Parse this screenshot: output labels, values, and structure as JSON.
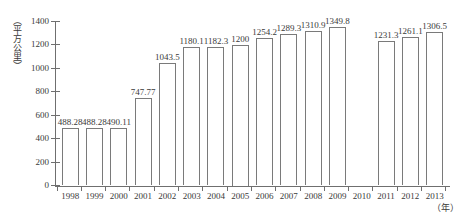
{
  "chart_data": {
    "type": "bar",
    "title": "",
    "xlabel": "（年）",
    "ylabel": "（平方公里）",
    "categories": [
      "1998",
      "1999",
      "2000",
      "2001",
      "2002",
      "2003",
      "2004",
      "2005",
      "2006",
      "2007",
      "2008",
      "2009",
      "2010",
      "2011",
      "2012",
      "2013"
    ],
    "values": [
      488.28,
      488.28,
      490.11,
      747.77,
      1043.5,
      1180.1,
      1182.3,
      1200,
      1254.2,
      1289.3,
      1310.9,
      1349.8,
      null,
      1231.3,
      1261.1,
      1306.5
    ],
    "value_labels": [
      "488.28",
      "488.28",
      "490.11",
      "747.77",
      "1043.5",
      "1180.1",
      "1182.3",
      "1200",
      "1254.2",
      "1289.3",
      "1310.9",
      "1349.8",
      "",
      "1231.3",
      "1261.1",
      "1306.5"
    ],
    "ylim": [
      0,
      1400
    ],
    "ytick_values": [
      0,
      200,
      400,
      600,
      800,
      1000,
      1200,
      1400
    ],
    "ytick_labels": [
      "0",
      "200",
      "400",
      "600",
      "800",
      "1000",
      "1200",
      "1400"
    ],
    "grid": false,
    "legend": null,
    "bar_fill_color": "#ffffff",
    "bar_border_color": "#7a7a7a",
    "axis_color": "#6f6f6f",
    "text_color": "#3a3a3a"
  }
}
